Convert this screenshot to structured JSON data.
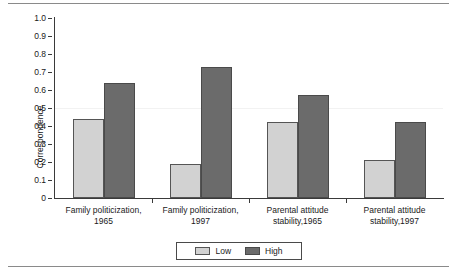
{
  "chart_data": {
    "type": "bar",
    "title": "",
    "xlabel": "",
    "ylabel": "Correspondence",
    "ylim": [
      0,
      1.0
    ],
    "ytick_labels": [
      "1.0",
      "0.9",
      "0.8",
      "0.7",
      "0.6",
      "0.5",
      "0.4",
      "0.3",
      "0.2",
      "0.1",
      "0"
    ],
    "ytick_values": [
      1.0,
      0.9,
      0.8,
      0.7,
      0.6,
      0.5,
      0.4,
      0.3,
      0.2,
      0.1,
      0
    ],
    "grid": false,
    "legend_position": "bottom-center",
    "categories": [
      "Family politicization, 1965",
      "Family politicization, 1997",
      "Parental attitude stability,1965",
      "Parental attitude stability,1997"
    ],
    "category_lines": [
      [
        "Family politicization,",
        "1965"
      ],
      [
        "Family politicization,",
        "1997"
      ],
      [
        "Parental attitude",
        "stability,1965"
      ],
      [
        "Parental attitude",
        "stability,1997"
      ]
    ],
    "series": [
      {
        "name": "Low",
        "color": "#d2d2d2",
        "values": [
          0.44,
          0.19,
          0.42,
          0.21
        ]
      },
      {
        "name": "High",
        "color": "#6b6b6b",
        "values": [
          0.64,
          0.73,
          0.57,
          0.42
        ]
      }
    ]
  },
  "legend": {
    "items": [
      {
        "label": "Low"
      },
      {
        "label": "High"
      }
    ]
  },
  "colors": {
    "low": "#d2d2d2",
    "high": "#6b6b6b",
    "axis": "#3a3a3a",
    "background": "#ffffff"
  }
}
